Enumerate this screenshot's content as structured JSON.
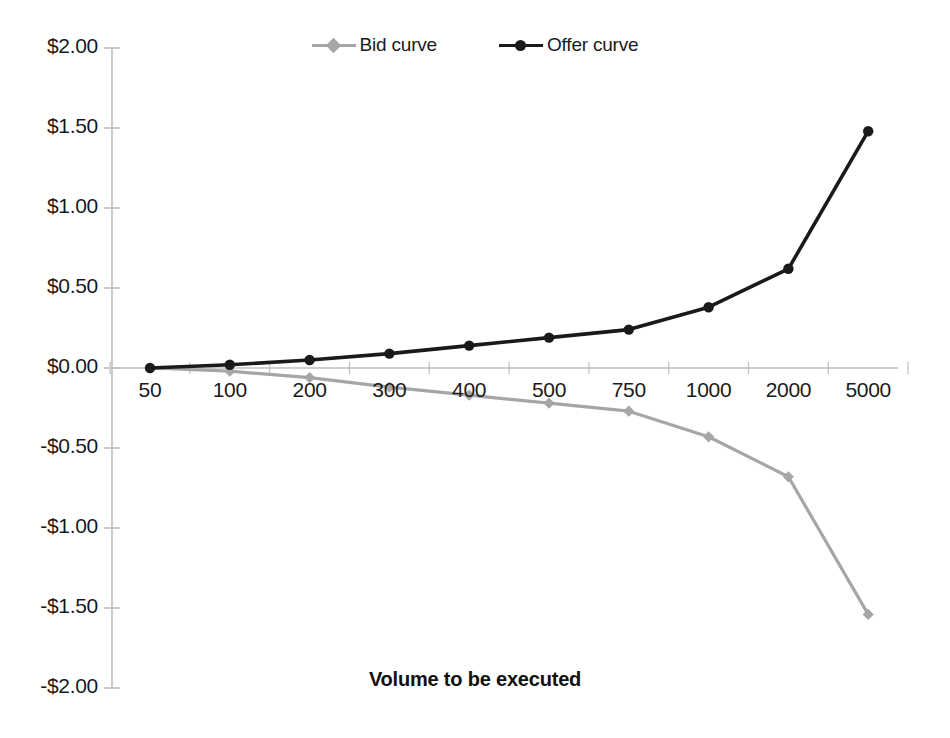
{
  "chart_data": {
    "type": "line",
    "title": "",
    "xlabel": "Volume to be executed",
    "ylabel": "",
    "categories": [
      "50",
      "100",
      "200",
      "300",
      "400",
      "500",
      "750",
      "1000",
      "2000",
      "5000"
    ],
    "series": [
      {
        "name": "Bid curve",
        "color": "#a6a6a6",
        "marker": "diamond",
        "values": [
          0.0,
          -0.02,
          -0.06,
          -0.12,
          -0.17,
          -0.22,
          -0.27,
          -0.43,
          -0.68,
          -1.54
        ]
      },
      {
        "name": "Offer curve",
        "color": "#1a1a1a",
        "marker": "circle",
        "values": [
          0.0,
          0.02,
          0.05,
          0.09,
          0.14,
          0.19,
          0.24,
          0.38,
          0.62,
          1.48
        ]
      }
    ],
    "ylim": [
      -2.0,
      2.0
    ],
    "ytick_values": [
      2.0,
      1.5,
      1.0,
      0.5,
      0.0,
      -0.5,
      -1.0,
      -1.5,
      -2.0
    ],
    "ytick_labels": [
      "$2.00",
      "$1.50",
      "$1.00",
      "$0.50",
      "$0.00",
      "-$0.50",
      "-$1.00",
      "-$1.50",
      "-$2.00"
    ],
    "grid": false,
    "legend_position": "top-center",
    "axis_color": "#bfbfbf",
    "background": "#ffffff"
  },
  "legend": {
    "entries": [
      {
        "label": "Bid curve",
        "color": "#a6a6a6",
        "marker": "diamond"
      },
      {
        "label": "Offer curve",
        "color": "#1a1a1a",
        "marker": "circle"
      }
    ]
  },
  "axis": {
    "x_title": "Volume to be executed"
  }
}
